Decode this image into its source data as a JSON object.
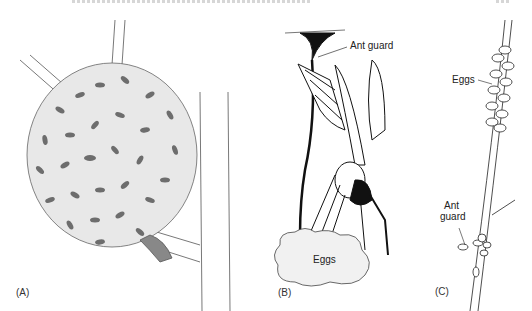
{
  "figure": {
    "panels": [
      {
        "id": "A",
        "label": "(A)",
        "subject": "swarm of wasps on branch"
      },
      {
        "id": "B",
        "label": "(B)",
        "subject": "wasp guarding eggs on stalk",
        "annotations": [
          "Ant guard",
          "Eggs"
        ]
      },
      {
        "id": "C",
        "label": "(C)",
        "subject": "eggs along twig",
        "annotations": [
          "Eggs",
          "Ant guard"
        ]
      }
    ],
    "labels": {
      "a_panel": "(A)",
      "b_panel": "(B)",
      "c_panel": "(C)",
      "b_ant_guard": "Ant guard",
      "b_eggs": "Eggs",
      "c_eggs": "Eggs",
      "c_ant_line1": "Ant",
      "c_ant_line2": "guard"
    }
  }
}
